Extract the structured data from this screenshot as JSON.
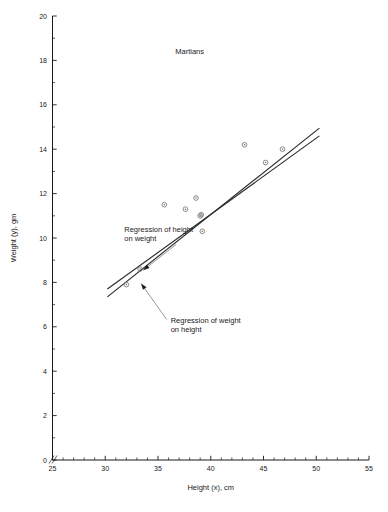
{
  "chart_data": {
    "type": "scatter",
    "title": "Martians",
    "xlabel": "Height (x), cm",
    "ylabel": "Weight (y), gm",
    "xlim": [
      25,
      55
    ],
    "ylim": [
      0,
      20
    ],
    "xticks": [
      25,
      30,
      35,
      40,
      45,
      50,
      55
    ],
    "yticks": [
      0,
      2,
      4,
      6,
      8,
      10,
      12,
      14,
      16,
      18,
      20
    ],
    "xtick_labels": [
      "25",
      "30",
      "35",
      "40",
      "45",
      "50",
      "55"
    ],
    "ytick_labels": [
      "0",
      "2",
      "4",
      "6",
      "8",
      "10",
      "12",
      "14",
      "16",
      "18",
      "20"
    ],
    "x_minor_step": 1,
    "y_minor_step": 1,
    "grid": false,
    "legend": "none",
    "axis_break": true,
    "points": [
      {
        "x": 32.0,
        "y": 7.9
      },
      {
        "x": 33.3,
        "y": 8.6
      },
      {
        "x": 35.6,
        "y": 11.5
      },
      {
        "x": 37.6,
        "y": 11.3
      },
      {
        "x": 38.6,
        "y": 11.8
      },
      {
        "x": 39.0,
        "y": 11.0
      },
      {
        "x": 39.2,
        "y": 10.3
      },
      {
        "x": 43.2,
        "y": 14.2
      },
      {
        "x": 45.2,
        "y": 13.4
      },
      {
        "x": 46.8,
        "y": 14.0
      },
      {
        "x": 39.1,
        "y": 11.05
      }
    ],
    "series": [
      {
        "name": "Regression of height on weight",
        "type": "line",
        "x": [
          30.2,
          50.3
        ],
        "y": [
          7.35,
          14.95
        ]
      },
      {
        "name": "Regression of weight on height",
        "type": "line",
        "x": [
          30.2,
          50.3
        ],
        "y": [
          7.7,
          14.6
        ]
      }
    ],
    "annotations": [
      {
        "name": "regression-height-on-weight",
        "text_line1": "Regression of height",
        "text_line2": "on weight",
        "text_x": 31.8,
        "text_y": 10.25,
        "arrow_to_x": 33.6,
        "arrow_to_y": 8.55
      },
      {
        "name": "regression-weight-on-height",
        "text_line1": "Regression of weight",
        "text_line2": "on height",
        "text_x": 36.2,
        "text_y": 6.15,
        "arrow_to_x": 33.4,
        "arrow_to_y": 7.95
      }
    ],
    "title_x": 38.0,
    "title_y": 18.3
  }
}
